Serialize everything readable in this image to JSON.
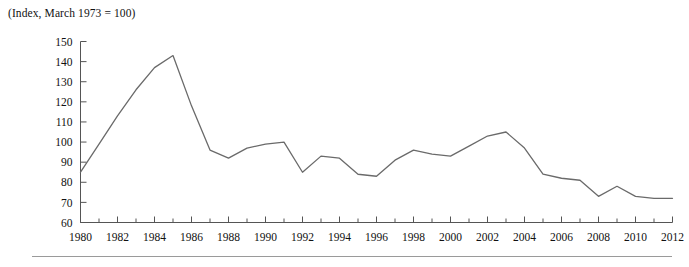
{
  "chart": {
    "title": "(Index, March 1973 = 100)",
    "ylabel": "",
    "xlabel": ""
  },
  "chart_data": {
    "type": "line",
    "title": "(Index, March 1973 = 100)",
    "xlabel": "",
    "ylabel": "",
    "xlim": [
      1980,
      2012
    ],
    "ylim": [
      60,
      150
    ],
    "grid": false,
    "legend": null,
    "ytick_labels": [
      "60",
      "70",
      "80",
      "90",
      "100",
      "110",
      "120",
      "130",
      "140",
      "150"
    ],
    "yticks": [
      60,
      70,
      80,
      90,
      100,
      110,
      120,
      130,
      140,
      150
    ],
    "xtick_labels": [
      "1980",
      "1982",
      "1984",
      "1986",
      "1988",
      "1990",
      "1992",
      "1994",
      "1996",
      "1998",
      "2000",
      "2002",
      "2004",
      "2006",
      "2008",
      "2010",
      "2012"
    ],
    "xticks": [
      1980,
      1982,
      1984,
      1986,
      1988,
      1990,
      1992,
      1994,
      1996,
      1998,
      2000,
      2002,
      2004,
      2006,
      2008,
      2010,
      2012
    ],
    "xticks_minor": [
      1981,
      1983,
      1985,
      1987,
      1989,
      1991,
      1993,
      1995,
      1997,
      1999,
      2001,
      2003,
      2005,
      2007,
      2009,
      2011
    ],
    "series": [
      {
        "name": "Effective exchange rate index",
        "color": "#6a6a6a",
        "x": [
          1980,
          1981,
          1982,
          1983,
          1984,
          1985,
          1986,
          1987,
          1988,
          1989,
          1990,
          1991,
          1992,
          1993,
          1994,
          1995,
          1996,
          1997,
          1998,
          1999,
          2000,
          2001,
          2002,
          2003,
          2004,
          2005,
          2006,
          2007,
          2008,
          2009,
          2010,
          2011,
          2012
        ],
        "values": [
          85,
          99,
          113,
          126,
          137,
          143,
          118,
          96,
          92,
          97,
          99,
          100,
          85,
          93,
          92,
          84,
          83,
          91,
          96,
          94,
          93,
          98,
          103,
          105,
          97,
          84,
          82,
          81,
          73,
          78,
          73,
          72,
          72
        ]
      }
    ]
  }
}
